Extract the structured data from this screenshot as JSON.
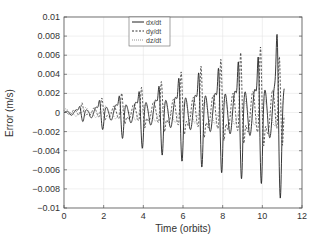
{
  "chart_data": {
    "type": "line",
    "title": "",
    "xlabel": "Time  (orbits)",
    "ylabel": "Error  (m/s)",
    "xlim": [
      0,
      12
    ],
    "ylim": [
      -0.01,
      0.01
    ],
    "xticks": [
      0,
      2,
      4,
      6,
      8,
      10,
      12
    ],
    "xtick_labels": [
      "0",
      "2",
      "4",
      "6",
      "8",
      "10",
      "12"
    ],
    "yticks": [
      -0.01,
      -0.008,
      -0.006,
      -0.004,
      -0.002,
      0,
      0.002,
      0.004,
      0.006,
      0.008,
      0.01
    ],
    "ytick_labels": [
      "-0.01",
      "-0.008",
      "-0.006",
      "-0.004",
      "-0.002",
      "0",
      "0.002",
      "0.004",
      "0.006",
      "0.008",
      "0.01"
    ],
    "grid": true,
    "legend_position": "upper right",
    "x_end": 11.1,
    "series": [
      {
        "name": "dx/dt",
        "style": "solid",
        "color": "#222222",
        "peak_orbits": [
          0.8,
          1.8,
          2.8,
          3.8,
          4.8,
          5.8,
          6.8,
          7.8,
          8.8,
          9.8,
          10.75
        ],
        "peak_values": [
          0.0008,
          0.0016,
          0.0022,
          0.0028,
          0.0035,
          0.0045,
          0.0052,
          0.0058,
          0.0066,
          0.0072,
          0.0081
        ],
        "trough_values": [
          -0.0008,
          -0.0015,
          -0.0023,
          -0.0032,
          -0.0038,
          -0.0043,
          -0.0048,
          -0.0053,
          -0.0058,
          -0.0062,
          -0.0066
        ]
      },
      {
        "name": "dy/dt",
        "style": "dashed",
        "color": "#333333",
        "peak_orbits": [
          0.9,
          1.9,
          2.9,
          3.9,
          4.9,
          5.9,
          6.9,
          7.9,
          8.9,
          9.9,
          10.85
        ],
        "peak_values": [
          0.001,
          0.0015,
          0.002,
          0.0026,
          0.0032,
          0.0042,
          0.0048,
          0.0055,
          0.0062,
          0.0068,
          0.0072
        ],
        "trough_values": [
          -0.0006,
          -0.0012,
          -0.0018,
          -0.0024,
          -0.003,
          -0.0035,
          -0.004,
          -0.0045,
          -0.005,
          -0.0054,
          -0.0058
        ]
      },
      {
        "name": "dz/dt",
        "style": "dotted",
        "color": "#777777",
        "peak_orbits": [
          0.5,
          1.5,
          2.5,
          3.5,
          4.5,
          5.5,
          6.5,
          7.5,
          8.5,
          9.5,
          10.5
        ],
        "peak_values": [
          0.0006,
          0.0008,
          0.001,
          0.0012,
          0.0014,
          0.0016,
          0.0017,
          0.0018,
          0.0019,
          0.002,
          0.0021
        ],
        "trough_values": [
          -0.0004,
          -0.0005,
          -0.0006,
          -0.0007,
          -0.0008,
          -0.0009,
          -0.001,
          -0.0011,
          -0.0012,
          -0.0013,
          -0.0014
        ]
      }
    ]
  }
}
